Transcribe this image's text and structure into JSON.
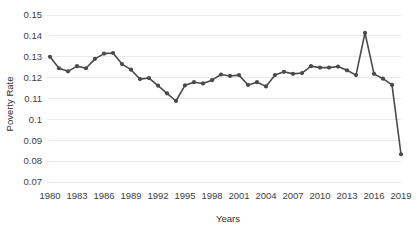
{
  "chart_data": {
    "type": "line",
    "title": "",
    "xlabel": "Years",
    "ylabel": "Poverty Rate",
    "xlim": [
      1980,
      2019
    ],
    "ylim": [
      0.07,
      0.15
    ],
    "grid": true,
    "legend": "none",
    "marker": "circle",
    "line_color": "#4a4a4a",
    "grid_color": "#e9e9e9",
    "ytick_labels": [
      "0.15",
      "0.14",
      "0.13",
      "0.12",
      "0.11",
      "0.1",
      "0.09",
      "0.08",
      "0.07"
    ],
    "ytick_values": [
      0.15,
      0.14,
      0.13,
      0.12,
      0.11,
      0.1,
      0.09,
      0.08,
      0.07
    ],
    "xtick_labels": [
      "1980",
      "1983",
      "1986",
      "1989",
      "1992",
      "1995",
      "1998",
      "2001",
      "2004",
      "2007",
      "2010",
      "2013",
      "2016",
      "2019"
    ],
    "xtick_values": [
      1980,
      1983,
      1986,
      1989,
      1992,
      1995,
      1998,
      2001,
      2004,
      2007,
      2010,
      2013,
      2016,
      2019
    ],
    "x": [
      1980,
      1981,
      1982,
      1983,
      1984,
      1985,
      1986,
      1987,
      1988,
      1989,
      1990,
      1991,
      1992,
      1993,
      1994,
      1995,
      1996,
      1997,
      1998,
      1999,
      2000,
      2001,
      2002,
      2003,
      2004,
      2005,
      2006,
      2007,
      2008,
      2009,
      2010,
      2011,
      2012,
      2013,
      2014,
      2015,
      2016,
      2017,
      2018,
      2019
    ],
    "values": [
      0.13,
      0.1245,
      0.123,
      0.1255,
      0.1245,
      0.129,
      0.1315,
      0.1318,
      0.1265,
      0.1238,
      0.1193,
      0.1198,
      0.1162,
      0.1125,
      0.1088,
      0.1163,
      0.1178,
      0.1172,
      0.1188,
      0.1215,
      0.1208,
      0.1212,
      0.1165,
      0.1178,
      0.1158,
      0.1212,
      0.1228,
      0.1218,
      0.1222,
      0.1255,
      0.1248,
      0.1248,
      0.1253,
      0.1235,
      0.1212,
      0.1414,
      0.1218,
      0.1195,
      0.1165,
      0.0833
    ]
  }
}
